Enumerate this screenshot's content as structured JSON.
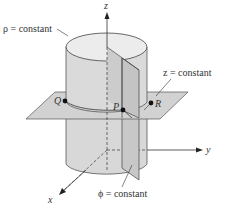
{
  "figure": {
    "labels": {
      "rho_surface": "ρ = constant",
      "z_surface": "z = constant",
      "phi_surface": "ϕ = constant"
    },
    "axes": {
      "x": "x",
      "y": "y",
      "z": "z"
    },
    "points": {
      "Q": "Q",
      "P": "P",
      "R": "R"
    },
    "colors": {
      "surface_fill": "#d6d6d6",
      "plane_fill": "#cfcfcf",
      "phi_plane_fill": "#c4c4c4",
      "line": "#333333",
      "background": "#ffffff"
    }
  }
}
